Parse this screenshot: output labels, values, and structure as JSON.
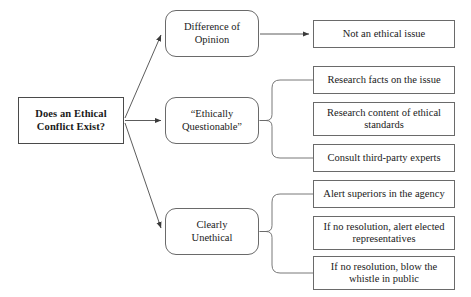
{
  "diagram": {
    "title": "Does an Ethical Conflict Exist?",
    "type": "decision-flowchart",
    "background_color": "#ffffff",
    "line_color": "#5a5a5a",
    "text_color": "#1a1a1a"
  },
  "nodes": {
    "root": {
      "label": "Does an Ethical\nConflict Exist?",
      "shape": "rectangle",
      "bold": true,
      "x": 18,
      "y": 97,
      "w": 106,
      "h": 47
    },
    "stages": [
      {
        "id": "difference-of-opinion",
        "label": "Difference of\nOpinion",
        "shape": "rounded-rectangle",
        "x": 165,
        "y": 10,
        "w": 94,
        "h": 47
      },
      {
        "id": "ethically-questionable",
        "label": "“Ethically\nQuestionable”",
        "shape": "rounded-rectangle",
        "x": 165,
        "y": 97,
        "w": 94,
        "h": 47
      },
      {
        "id": "clearly-unethical",
        "label": "Clearly\nUnethical",
        "shape": "rounded-rectangle",
        "x": 165,
        "y": 208,
        "w": 94,
        "h": 47
      }
    ],
    "outcomes": [
      {
        "id": "not-an-ethical-issue",
        "label": "Not an ethical issue",
        "parent": "difference-of-opinion",
        "x": 313,
        "y": 20,
        "w": 142,
        "h": 28
      },
      {
        "id": "research-facts",
        "label": "Research facts on the issue",
        "parent": "ethically-questionable",
        "x": 313,
        "y": 66,
        "w": 142,
        "h": 28
      },
      {
        "id": "research-standards",
        "label": "Research content of ethical\nstandards",
        "parent": "ethically-questionable",
        "x": 313,
        "y": 102,
        "w": 142,
        "h": 34
      },
      {
        "id": "consult-experts",
        "label": "Consult third-party experts",
        "parent": "ethically-questionable",
        "x": 313,
        "y": 144,
        "w": 142,
        "h": 28
      },
      {
        "id": "alert-superiors",
        "label": "Alert superiors in the agency",
        "parent": "clearly-unethical",
        "x": 313,
        "y": 180,
        "w": 142,
        "h": 28
      },
      {
        "id": "alert-elected",
        "label": "If no resolution, alert elected\nrepresentatives",
        "parent": "clearly-unethical",
        "x": 313,
        "y": 216,
        "w": 142,
        "h": 34
      },
      {
        "id": "blow-whistle",
        "label": "If no resolution, blow the\nwhistle in public",
        "parent": "clearly-unethical",
        "x": 313,
        "y": 256,
        "w": 142,
        "h": 34
      }
    ]
  },
  "connectors": {
    "arrows": [
      {
        "id": "root-to-difference",
        "kind": "diagonal-arrow",
        "from": "root",
        "to": "difference-of-opinion"
      },
      {
        "id": "root-to-questionable",
        "kind": "straight-arrow",
        "from": "root",
        "to": "ethically-questionable"
      },
      {
        "id": "root-to-unethical",
        "kind": "diagonal-arrow",
        "from": "root",
        "to": "clearly-unethical"
      },
      {
        "id": "difference-to-outcome",
        "kind": "straight-arrow",
        "from": "difference-of-opinion",
        "to": "not-an-ethical-issue"
      }
    ],
    "braces": [
      {
        "id": "questionable-brace",
        "kind": "curly-brace",
        "from": "ethically-questionable",
        "branches": 3
      },
      {
        "id": "unethical-brace",
        "kind": "curly-brace",
        "from": "clearly-unethical",
        "branches": 3
      }
    ]
  }
}
